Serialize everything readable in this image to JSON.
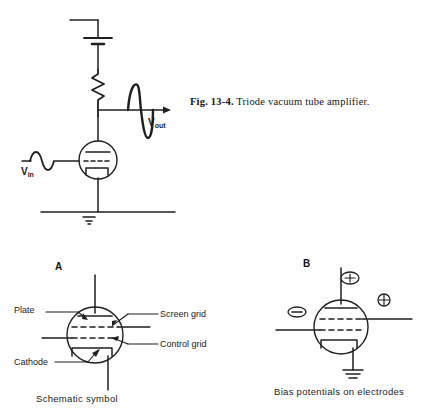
{
  "figure": {
    "caption_number": "Fig. 13-4.",
    "caption_text": "Triode vacuum tube amplifier.",
    "caption_full": "Fig. 13-4. Triode vacuum tube amplifier."
  },
  "circuit": {
    "input_label": "V",
    "input_subscript": "in",
    "output_label": "V",
    "output_subscript": "out",
    "components": [
      "battery",
      "resistor",
      "triode-tube",
      "ground",
      "input-sine-wave",
      "output-sine-wave"
    ]
  },
  "panel_a": {
    "letter": "A",
    "caption": "Schematic symbol",
    "labels": {
      "plate": "Plate",
      "cathode": "Cathode",
      "screen_grid": "Screen grid",
      "control_grid": "Control grid"
    }
  },
  "panel_b": {
    "letter": "B",
    "caption": "Bias potentials on electrodes",
    "polarities": {
      "plate": "+",
      "screen_grid": "+",
      "control_grid": "−"
    }
  },
  "colors": {
    "background": "#ffffff",
    "ink": "#1a1a1a",
    "line": "#222222"
  }
}
